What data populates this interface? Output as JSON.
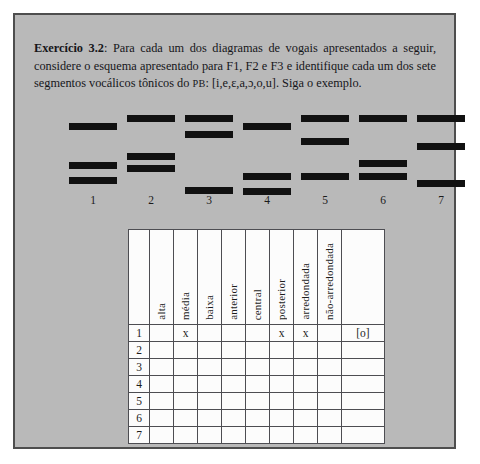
{
  "exercise": {
    "label": "Exercício 3.2",
    "separator": ":",
    "body_part1": " Para cada um dos diagramas de vogais apresentados a seguir, considere o esquema apresentado para F1, F2 e F3 e identifique cada um dos sete segmentos vocálicos tônicos do ",
    "language_abbrev": "PB",
    "body_part2": ": [i,e,ɛ,a,ɔ,o,u]. Siga o exemplo."
  },
  "diagrams": {
    "count": 7,
    "bar_color": "#111111",
    "items": [
      {
        "label": "1",
        "left": 10,
        "bars": [
          15,
          54,
          69
        ]
      },
      {
        "label": "2",
        "left": 68,
        "bars": [
          7,
          45,
          57
        ]
      },
      {
        "label": "3",
        "left": 126,
        "bars": [
          7,
          23,
          79
        ]
      },
      {
        "label": "4",
        "left": 184,
        "bars": [
          15,
          65,
          80
        ]
      },
      {
        "label": "5",
        "left": 242,
        "bars": [
          7,
          30,
          65
        ]
      },
      {
        "label": "6",
        "left": 300,
        "bars": [
          7,
          52,
          65
        ]
      },
      {
        "label": "7",
        "left": 358,
        "bars": [
          7,
          35,
          72
        ]
      }
    ]
  },
  "answer_table": {
    "corner_header": "",
    "headers": [
      "alta",
      "média",
      "baixa",
      "anterior",
      "central",
      "posterior",
      "arredondada",
      "não-arredondada"
    ],
    "answer_header": "",
    "rows": [
      {
        "num": "1",
        "marks": [
          "",
          "x",
          "",
          "",
          "",
          "x",
          "x",
          ""
        ],
        "answer": "[o]"
      },
      {
        "num": "2",
        "marks": [
          "",
          "",
          "",
          "",
          "",
          "",
          "",
          ""
        ],
        "answer": ""
      },
      {
        "num": "3",
        "marks": [
          "",
          "",
          "",
          "",
          "",
          "",
          "",
          ""
        ],
        "answer": ""
      },
      {
        "num": "4",
        "marks": [
          "",
          "",
          "",
          "",
          "",
          "",
          "",
          ""
        ],
        "answer": ""
      },
      {
        "num": "5",
        "marks": [
          "",
          "",
          "",
          "",
          "",
          "",
          "",
          ""
        ],
        "answer": ""
      },
      {
        "num": "6",
        "marks": [
          "",
          "",
          "",
          "",
          "",
          "",
          "",
          ""
        ],
        "answer": ""
      },
      {
        "num": "7",
        "marks": [
          "",
          "",
          "",
          "",
          "",
          "",
          "",
          ""
        ],
        "answer": ""
      }
    ]
  },
  "colors": {
    "panel_background": "#b9b9b9",
    "panel_border": "#4e4e4e",
    "table_background": "#fcfcfc",
    "table_border": "#4d4d52",
    "text": "#16161a"
  }
}
